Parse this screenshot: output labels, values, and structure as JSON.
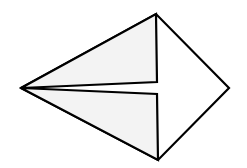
{
  "diagram": {
    "type": "origami-kite-fold",
    "width": 247,
    "height": 168,
    "colors": {
      "background": "#ffffff",
      "stroke": "#000000",
      "flap_fill": "#f3f3f3",
      "body_fill": "#ffffff"
    },
    "stroke_width": 2.2,
    "vertices": {
      "left_tip": [
        21,
        88
      ],
      "top": [
        156,
        14
      ],
      "right": [
        229,
        88
      ],
      "bottom": [
        158,
        160
      ],
      "inner_upper": [
        157,
        82
      ],
      "inner_lower": [
        157,
        94
      ]
    }
  }
}
